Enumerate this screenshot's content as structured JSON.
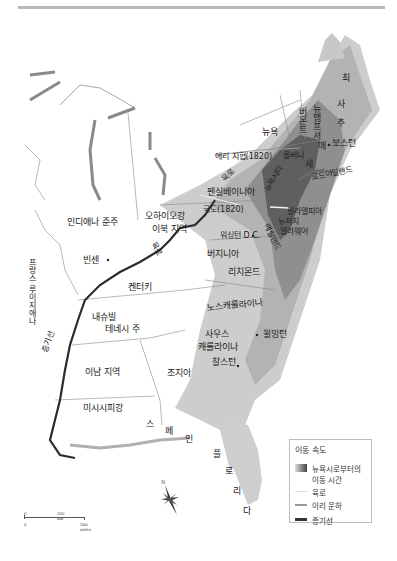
{
  "map": {
    "title_rule": true,
    "regions": {
      "maine": "최",
      "vermont": "버몬트",
      "new_hampshire": "뉴햄프셔",
      "massachusetts_chars": [
        "매",
        "사",
        "추",
        "세",
        "츠"
      ],
      "new_york": "뉴욕",
      "rhode_island": "로드아일랜드",
      "pennsylvania": "펜실베이니아",
      "new_york_city": "뉴욕시티",
      "new_jersey": "뉴저지",
      "delaware": "델라웨어",
      "maryland": "메릴랜드",
      "virginia": "버지니아",
      "north_carolina": "노스캐롤라이나",
      "south_carolina_line1": "사우스",
      "south_carolina_line2": "캐롤라이나",
      "georgia": "조지아",
      "kentucky": "켄터키",
      "tennessee_line1": "내슈빌",
      "tennessee_line2": "테네시 주",
      "ohio_line1": "오하이오강",
      "ohio_line2": "이북 지역",
      "indiana": "인디애나 준주",
      "illinois": "이남 지역",
      "mississippi": "미시시피강",
      "french_louisiana": "프랑스 루이지애나",
      "spain_chars": [
        "스",
        "페",
        "인"
      ],
      "florida_chars": [
        "플",
        "로",
        "리",
        "다"
      ]
    },
    "cities": {
      "boston": "보스턴",
      "albany": "올버니",
      "philadelphia": "필라델피아",
      "washington": "워싱턴 D.C.",
      "richmond": "리치몬드",
      "wilmington": "윌밍턴",
      "charleston": "찰스턴",
      "vincennes": "빈센"
    },
    "routes": {
      "erie_canal": "에리 지협(1820)",
      "national_road": "국도(1820)",
      "land_route_a": "육로",
      "land_route_b": "육로",
      "steamboat": "증기선"
    }
  },
  "legend": {
    "title": "이동 속도",
    "items": [
      {
        "label_line1": "뉴욕시로부터의",
        "label_line2": "이동 시간",
        "swatch": "gradient"
      },
      {
        "label_line1": "육로",
        "swatch": "land"
      },
      {
        "label_line1": "이리 운하",
        "swatch": "canal"
      },
      {
        "label_line1": "증기선",
        "swatch": "steam"
      }
    ]
  },
  "scale_bar": {
    "km_zero": "0",
    "km_label": "200 km",
    "mi_zero": "0",
    "mi_label": "200 miles"
  },
  "compass": {
    "north_label": "N"
  },
  "colors": {
    "darkest": "#4a4a4a",
    "dark": "#6e6e6e",
    "mid": "#8f8f8f",
    "light": "#b3b3b3",
    "lighter": "#cdcdcd",
    "lightest": "#e3e3e3",
    "steamboat_line": "#2b2b2b"
  }
}
